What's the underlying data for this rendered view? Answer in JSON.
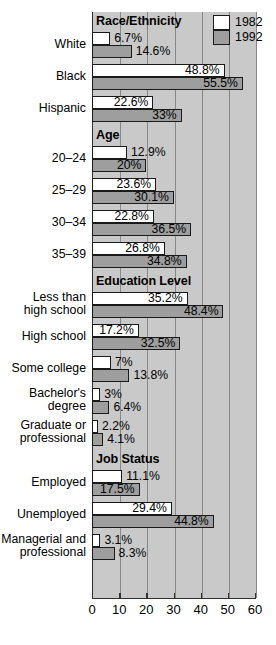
{
  "chart_data": {
    "type": "bar",
    "orientation": "horizontal",
    "title": "",
    "xlabel": "",
    "ylabel": "",
    "xlim": [
      0,
      60
    ],
    "xticks": [
      0,
      10,
      20,
      30,
      40,
      50,
      60
    ],
    "xtick_labels": [
      "0",
      "10",
      "20",
      "30",
      "40",
      "50",
      "60"
    ],
    "grid": true,
    "grid_axis": "x",
    "legend_position": "top-right",
    "value_suffix": "%",
    "series": [
      {
        "name": "1982",
        "color": "#ffffff",
        "values": [
          6.7,
          48.8,
          22.6,
          12.9,
          23.6,
          22.8,
          26.8,
          35.2,
          17.2,
          7,
          3,
          2.2,
          11.1,
          29.4,
          3.1
        ],
        "labels": [
          "6.7%",
          "48.8%",
          "22.6%",
          "12.9%",
          "23.6%",
          "22.8%",
          "26.8%",
          "35.2%",
          "17.2%",
          "7%",
          "3%",
          "2.2%",
          "11.1%",
          "29.4%",
          "3.1%"
        ]
      },
      {
        "name": "1992",
        "color": "#9e9e9e",
        "values": [
          14.6,
          55.5,
          33,
          20,
          30.1,
          36.5,
          34.8,
          48.4,
          32.5,
          13.8,
          6.4,
          4.1,
          17.5,
          44.8,
          8.3
        ],
        "labels": [
          "14.6%",
          "55.5%",
          "33%",
          "20%",
          "30.1%",
          "36.5%",
          "34.8%",
          "48.4%",
          "32.5%",
          "13.8%",
          "6.4%",
          "4.1%",
          "17.5%",
          "44.8%",
          "8.3%"
        ]
      }
    ],
    "categories": [
      "White",
      "Black",
      "Hispanic",
      "20–24",
      "25–29",
      "30–34",
      "35–39",
      "Less than\nhigh school",
      "High school",
      "Some college",
      "Bachelor's\ndegree",
      "Graduate or\nprofessional",
      "Employed",
      "Unemployed",
      "Managerial and\nprofessional"
    ],
    "sections": [
      {
        "title": "Race/Ethnicity",
        "categories": [
          "White",
          "Black",
          "Hispanic"
        ]
      },
      {
        "title": "Age",
        "categories": [
          "20–24",
          "25–29",
          "30–34",
          "35–39"
        ]
      },
      {
        "title": "Education Level",
        "categories": [
          "Less than\nhigh school",
          "High school",
          "Some college",
          "Bachelor's\ndegree",
          "Graduate or\nprofessional"
        ]
      },
      {
        "title": "Job Status",
        "categories": [
          "Employed",
          "Unemployed",
          "Managerial and\nprofessional"
        ]
      }
    ]
  },
  "legend": {
    "entries": [
      {
        "label": "1982",
        "swatch": "white"
      },
      {
        "label": "1992",
        "swatch": "gray"
      }
    ]
  },
  "sections": {
    "race": "Race/Ethnicity",
    "age": "Age",
    "education": "Education Level",
    "job": "Job Status"
  },
  "colors": {
    "plot_background": "#c9c9c9",
    "gridline": "#888888",
    "bar_1982": "#ffffff",
    "bar_1992": "#9e9e9e",
    "bar_outline": "#1a1a1a",
    "axis": "#303030",
    "text": "#000000"
  }
}
